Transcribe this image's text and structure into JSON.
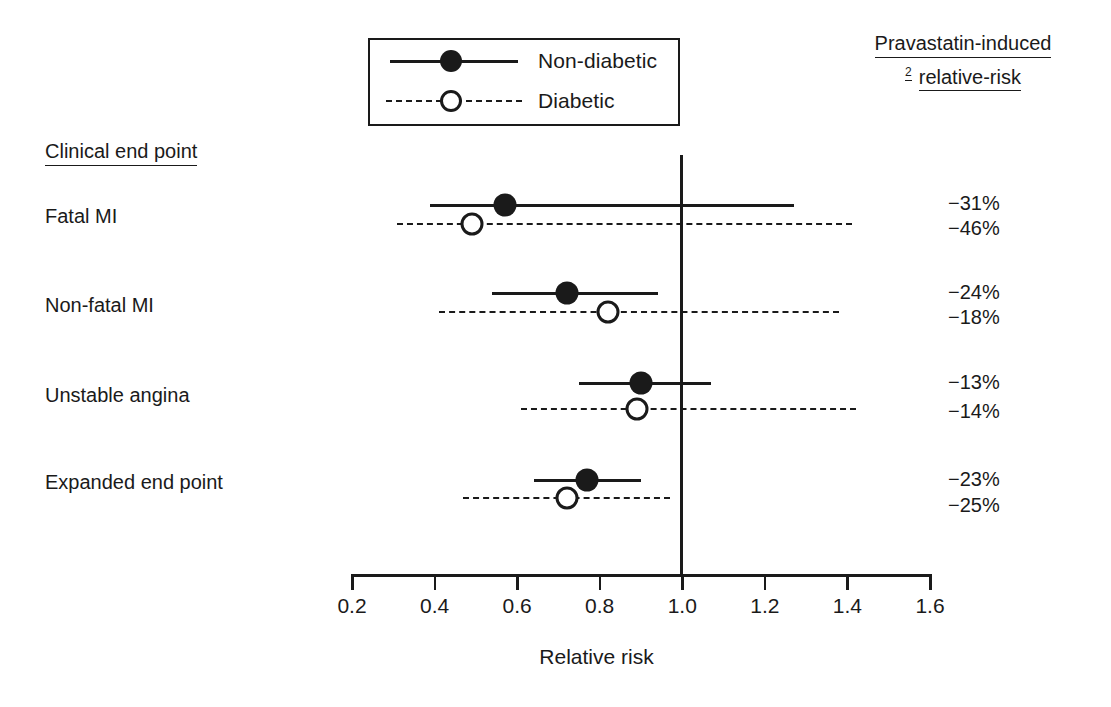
{
  "legend": {
    "items": [
      {
        "label": "Non-diabetic",
        "style": "solid",
        "marker": "filled-circle"
      },
      {
        "label": "Diabetic",
        "style": "dashed",
        "marker": "open-circle"
      }
    ]
  },
  "header": {
    "right_line1": "Pravastatin-induced",
    "right_superscript": "2",
    "right_line2": "relative-risk",
    "left_column_title": "Clinical end point"
  },
  "axis": {
    "title": "Relative risk",
    "ticks": [
      "0.2",
      "0.4",
      "0.6",
      "0.8",
      "1.0",
      "1.2",
      "1.4",
      "1.6"
    ],
    "reference_line": "1.0"
  },
  "rows": [
    {
      "label": "Fatal MI",
      "nondiabetic": {
        "point": 0.57,
        "low": 0.39,
        "high": 1.27,
        "percent": "−31%"
      },
      "diabetic": {
        "point": 0.49,
        "low": 0.31,
        "high": 1.41,
        "percent": "−46%"
      }
    },
    {
      "label": "Non-fatal MI",
      "nondiabetic": {
        "point": 0.72,
        "low": 0.54,
        "high": 0.94,
        "percent": "−24%"
      },
      "diabetic": {
        "point": 0.82,
        "low": 0.41,
        "high": 1.38,
        "percent": "−18%"
      }
    },
    {
      "label": "Unstable angina",
      "nondiabetic": {
        "point": 0.9,
        "low": 0.75,
        "high": 1.07,
        "percent": "−13%"
      },
      "diabetic": {
        "point": 0.89,
        "low": 0.61,
        "high": 1.42,
        "percent": "−14%"
      }
    },
    {
      "label": "Expanded end point",
      "nondiabetic": {
        "point": 0.77,
        "low": 0.64,
        "high": 0.9,
        "percent": "−23%"
      },
      "diabetic": {
        "point": 0.72,
        "low": 0.47,
        "high": 0.97,
        "percent": "−25%"
      }
    }
  ],
  "chart_data": {
    "type": "scatter",
    "subtype": "forest-plot",
    "title": "",
    "xlabel": "Relative risk",
    "ylabel": "",
    "xlim": [
      0.2,
      1.6
    ],
    "xticks": [
      0.2,
      0.4,
      0.6,
      0.8,
      1.0,
      1.2,
      1.4,
      1.6
    ],
    "grid": false,
    "reference_line_x": 1.0,
    "legend_position": "top-center",
    "categories": [
      "Fatal MI",
      "Non-fatal MI",
      "Unstable angina",
      "Expanded end point"
    ],
    "series": [
      {
        "name": "Non-diabetic",
        "style": "solid",
        "marker": "filled-circle",
        "values": [
          0.57,
          0.72,
          0.9,
          0.77
        ],
        "ci_low": [
          0.39,
          0.54,
          0.75,
          0.64
        ],
        "ci_high": [
          1.27,
          0.94,
          1.07,
          0.9
        ],
        "risk_reduction": [
          "−31%",
          "−24%",
          "−13%",
          "−23%"
        ]
      },
      {
        "name": "Diabetic",
        "style": "dashed",
        "marker": "open-circle",
        "values": [
          0.49,
          0.82,
          0.89,
          0.72
        ],
        "ci_low": [
          0.31,
          0.41,
          0.61,
          0.47
        ],
        "ci_high": [
          1.41,
          1.38,
          1.42,
          0.97
        ],
        "risk_reduction": [
          "−46%",
          "−18%",
          "−14%",
          "−25%"
        ]
      }
    ],
    "annotations": {
      "right_header": "Pravastatin-induced relative-risk",
      "right_header_superscript": "2",
      "left_header": "Clinical end point"
    }
  }
}
